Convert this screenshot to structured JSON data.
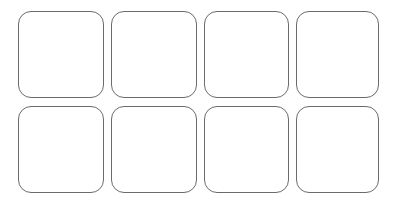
{
  "grid": {
    "rows": 2,
    "columns": 4,
    "tiles": [
      {
        "row": 1,
        "col": 1,
        "label": ""
      },
      {
        "row": 1,
        "col": 2,
        "label": ""
      },
      {
        "row": 1,
        "col": 3,
        "label": ""
      },
      {
        "row": 1,
        "col": 4,
        "label": ""
      },
      {
        "row": 2,
        "col": 1,
        "label": ""
      },
      {
        "row": 2,
        "col": 2,
        "label": ""
      },
      {
        "row": 2,
        "col": 3,
        "label": ""
      },
      {
        "row": 2,
        "col": 4,
        "label": ""
      }
    ],
    "border_color": "#6b6b6b",
    "background": "#ffffff"
  }
}
